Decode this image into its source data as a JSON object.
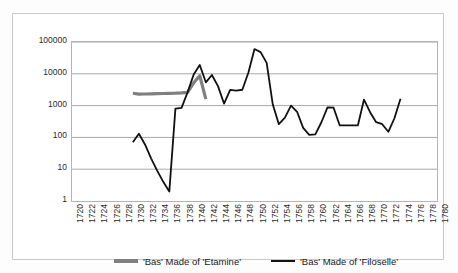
{
  "chart_data": {
    "type": "line",
    "title": "",
    "xlabel": "",
    "ylabel": "",
    "yscale": "log",
    "ylim": [
      1,
      100000
    ],
    "ytick_labels": [
      "100000",
      "10000",
      "1000",
      "100",
      "10",
      "1"
    ],
    "ytick_values": [
      100000,
      10000,
      1000,
      100,
      10,
      1
    ],
    "xlim": [
      1720,
      1780
    ],
    "xtick_labels": [
      "1720",
      "1722",
      "1724",
      "1726",
      "1728",
      "1730",
      "1732",
      "1734",
      "1736",
      "1738",
      "1740",
      "1742",
      "1744",
      "1746",
      "1748",
      "1750",
      "1752",
      "1754",
      "1756",
      "1758",
      "1760",
      "1762",
      "1764",
      "1766",
      "1768",
      "1770",
      "1772",
      "1774",
      "1776",
      "1778",
      "1780"
    ],
    "grid": "horizontal",
    "legend_position": "bottom",
    "series": [
      {
        "name": "'Bas' Made of 'Etamine'",
        "color": "#808080",
        "x": [
          1730,
          1731,
          1732,
          1733,
          1734,
          1735,
          1736,
          1737,
          1738,
          1739,
          1740,
          1741,
          1742
        ],
        "values": [
          2450,
          2300,
          2320,
          2350,
          2380,
          2400,
          2430,
          2450,
          2500,
          2600,
          5200,
          8700,
          1600
        ]
      },
      {
        "name": "'Bas' Made of 'Filoselle'",
        "color": "#111111",
        "x": [
          1730,
          1731,
          1732,
          1733,
          1734,
          1735,
          1736,
          1737,
          1738,
          1739,
          1740,
          1741,
          1742,
          1743,
          1744,
          1745,
          1746,
          1747,
          1748,
          1749,
          1750,
          1751,
          1752,
          1753,
          1754,
          1755,
          1756,
          1757,
          1758,
          1759,
          1760,
          1761,
          1762,
          1763,
          1764,
          1765,
          1766,
          1767,
          1768,
          1769,
          1770,
          1771,
          1772,
          1773,
          1774
        ],
        "values": [
          70,
          130,
          60,
          22,
          9,
          4,
          2,
          800,
          850,
          2600,
          9500,
          19000,
          5400,
          9200,
          4100,
          1150,
          3100,
          2950,
          3150,
          11000,
          60000,
          48000,
          22000,
          1100,
          260,
          420,
          1000,
          640,
          200,
          120,
          125,
          300,
          880,
          860,
          240,
          240,
          240,
          240,
          1550,
          620,
          300,
          260,
          150,
          400,
          1650
        ]
      }
    ]
  },
  "legend": {
    "entries": [
      {
        "label": "'Bas' Made of 'Etamine'",
        "color": "#808080"
      },
      {
        "label": "'Bas' Made of 'Filoselle'",
        "color": "#111111"
      }
    ]
  }
}
